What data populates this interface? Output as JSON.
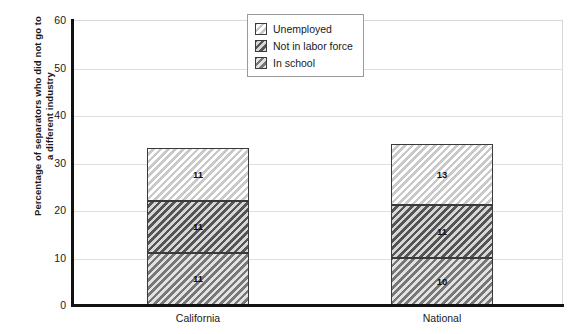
{
  "chart_data": {
    "type": "bar",
    "subtype": "stacked-bar",
    "title": "",
    "xlabel": "",
    "ylabel": "Percentage of separators who did not go to a different industry",
    "ylabel_line1": "Percentage of separators who did not go to",
    "ylabel_line2": "a different industry",
    "categories": [
      "California",
      "National"
    ],
    "ylim": [
      0,
      60
    ],
    "yticks": [
      0,
      10,
      20,
      30,
      40,
      50,
      60
    ],
    "ytick_labels": [
      "0",
      "10",
      "20",
      "30",
      "40",
      "50",
      "60"
    ],
    "grid": true,
    "legend_position": "top-center",
    "series": [
      {
        "name": "In school",
        "values": [
          11,
          10
        ],
        "labels": [
          "11",
          "10"
        ],
        "fill": "hatch-mid",
        "stack_order": 0
      },
      {
        "name": "Not in labor force",
        "values": [
          11,
          11
        ],
        "labels": [
          "11",
          "11"
        ],
        "fill": "hatch-dark",
        "stack_order": 1
      },
      {
        "name": "Unemployed",
        "values": [
          11,
          13
        ],
        "labels": [
          "11",
          "13"
        ],
        "fill": "hatch-light",
        "stack_order": 2
      }
    ],
    "totals": [
      34,
      35
    ]
  },
  "legend": {
    "items": [
      {
        "label": "Unemployed",
        "fill": "hatch-light"
      },
      {
        "label": "Not in labor force",
        "fill": "hatch-dark"
      },
      {
        "label": "In school",
        "fill": "hatch-mid"
      }
    ]
  },
  "colors": {
    "axis": "#111111",
    "gridline": "#dedede",
    "plot_border": "#d8d8d8",
    "segment_border": "#3a3a3a",
    "text": "#1a1a1a",
    "background": "#ffffff"
  }
}
